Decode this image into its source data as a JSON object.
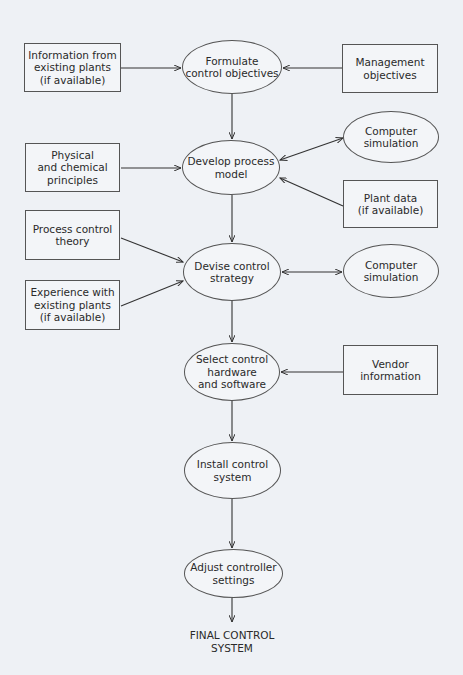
{
  "diagram": {
    "title": "",
    "colors": {
      "background": "#eef1f5",
      "stroke": "#333333",
      "text": "#2a2a2a"
    },
    "main_flow": [
      {
        "id": "formulate",
        "shape": "ellipse",
        "label": "Formulate\ncontrol objectives"
      },
      {
        "id": "develop",
        "shape": "ellipse",
        "label": "Develop process\nmodel"
      },
      {
        "id": "devise",
        "shape": "ellipse",
        "label": "Devise control\nstrategy"
      },
      {
        "id": "select",
        "shape": "ellipse",
        "label": "Select control\nhardware\nand software"
      },
      {
        "id": "install",
        "shape": "ellipse",
        "label": "Install control\nsystem"
      },
      {
        "id": "adjust",
        "shape": "ellipse",
        "label": "Adjust controller\nsettings"
      },
      {
        "id": "final",
        "shape": "text",
        "label": "FINAL CONTROL\nSYSTEM"
      }
    ],
    "inputs": [
      {
        "id": "info_existing",
        "shape": "box",
        "label": "Information from\nexisting plants\n(if available)",
        "target": "formulate"
      },
      {
        "id": "management",
        "shape": "box",
        "label": "Management\nobjectives",
        "target": "formulate"
      },
      {
        "id": "physical",
        "shape": "box",
        "label": "Physical\nand chemical\nprinciples",
        "target": "develop"
      },
      {
        "id": "sim1",
        "shape": "ellipse",
        "label": "Computer\nsimulation",
        "target": "develop",
        "bidirectional": true
      },
      {
        "id": "plant_data",
        "shape": "box",
        "label": "Plant data\n(if available)",
        "target": "develop"
      },
      {
        "id": "pc_theory",
        "shape": "box",
        "label": "Process control\ntheory",
        "target": "devise"
      },
      {
        "id": "experience",
        "shape": "box",
        "label": "Experience with\nexisting plants\n(if available)",
        "target": "devise"
      },
      {
        "id": "sim2",
        "shape": "ellipse",
        "label": "Computer\nsimulation",
        "target": "devise",
        "bidirectional": true
      },
      {
        "id": "vendor",
        "shape": "box",
        "label": "Vendor\ninformation",
        "target": "select"
      }
    ]
  }
}
